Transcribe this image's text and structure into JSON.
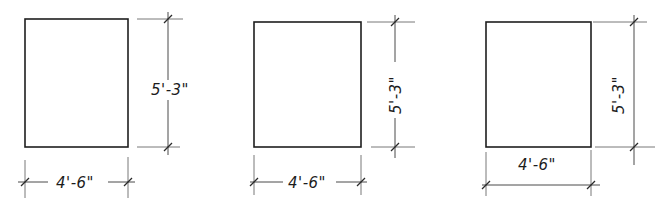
{
  "colors": {
    "background": "#ffffff",
    "line": "#1e1e1e",
    "extension": "#6a6a6a"
  },
  "drawings": [
    {
      "id": "drawing-1",
      "width_label": "4'-6\"",
      "height_label": "5'-3\"",
      "height_text_orientation": "horizontal"
    },
    {
      "id": "drawing-2",
      "width_label": "4'-6\"",
      "height_label": "5'-3\"",
      "height_text_orientation": "vertical-in-line"
    },
    {
      "id": "drawing-3",
      "width_label": "4'-6\"",
      "height_label": "5'-3\"",
      "height_text_orientation": "vertical-beside-line"
    }
  ]
}
